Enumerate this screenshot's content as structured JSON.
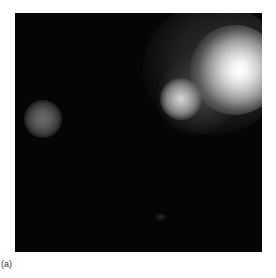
{
  "figure": {
    "panel_label": "(a)",
    "image_description": "Grayscale intensity image on black background showing a large bright blob in upper right, a smaller connected bright blob below-left of it, and a faint small blob on the left side",
    "features": [
      {
        "name": "primary-bright-spot",
        "position": "upper-right"
      },
      {
        "name": "secondary-bright-spot",
        "position": "right, below-left of primary"
      },
      {
        "name": "faint-spot",
        "position": "left-middle"
      }
    ]
  }
}
